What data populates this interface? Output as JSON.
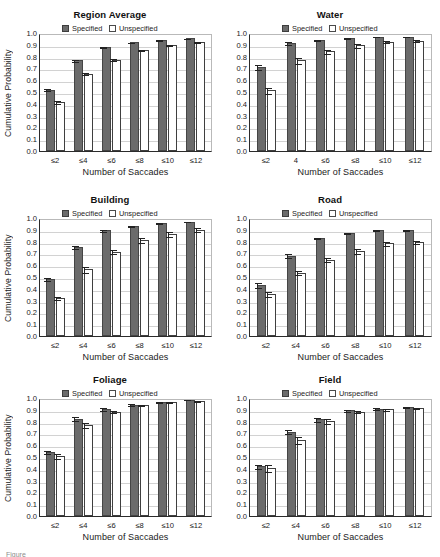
{
  "figure": {
    "legend": {
      "specified_label": "Specified",
      "unspecified_label": "Unspecified"
    },
    "axis": {
      "ylabel": "Cumulative Probability",
      "xlabel": "Number of Saccades",
      "yticks": [
        "1.0",
        "0.9",
        "0.8",
        "0.7",
        "0.6",
        "0.5",
        "0.4",
        "0.3",
        "0.2",
        "0.1",
        "0.0"
      ]
    },
    "caption_partial": "Figure"
  },
  "colors": {
    "specified_fill": "#6b6b6b",
    "specified_edge": "#454545",
    "unspecified_fill": "#ffffff",
    "unspecified_edge": "#3f3f3f",
    "gridline": "#d2d2d2",
    "axis": "#2b2b2b"
  },
  "chart_data": [
    {
      "type": "bar",
      "title": "Region Average",
      "xlabel": "Number of Saccades",
      "ylabel": "Cumulative Probability",
      "ylim": [
        0,
        1
      ],
      "grid": true,
      "legend_position": "top-center",
      "categories": [
        "≤2",
        "≤4",
        "≤6",
        "≤8",
        "≤10",
        "≤12"
      ],
      "series": [
        {
          "name": "Specified",
          "values": [
            0.52,
            0.77,
            0.88,
            0.92,
            0.94,
            0.955
          ],
          "errors": [
            0.012,
            0.012,
            0.008,
            0.008,
            0.006,
            0.005
          ]
        },
        {
          "name": "Unspecified",
          "values": [
            0.415,
            0.655,
            0.775,
            0.855,
            0.895,
            0.925
          ],
          "errors": [
            0.015,
            0.015,
            0.012,
            0.01,
            0.008,
            0.007
          ]
        }
      ]
    },
    {
      "type": "bar",
      "title": "Water",
      "xlabel": "Number of Saccades",
      "ylabel": "",
      "ylim": [
        0,
        1
      ],
      "grid": true,
      "legend_position": "top-center",
      "categories": [
        "≤2",
        "4",
        "≤6",
        "≤8",
        "≤10",
        "≤12"
      ],
      "series": [
        {
          "name": "Specified",
          "values": [
            0.71,
            0.915,
            0.94,
            0.955,
            0.97,
            0.97
          ],
          "errors": [
            0.025,
            0.015,
            0.01,
            0.008,
            0.006,
            0.006
          ]
        },
        {
          "name": "Unspecified",
          "values": [
            0.515,
            0.77,
            0.845,
            0.895,
            0.925,
            0.935
          ],
          "errors": [
            0.03,
            0.03,
            0.022,
            0.018,
            0.013,
            0.012
          ]
        }
      ]
    },
    {
      "type": "bar",
      "title": "Building",
      "xlabel": "Number of Saccades",
      "ylabel": "Cumulative Probability",
      "ylim": [
        0,
        1
      ],
      "grid": true,
      "legend_position": "top-center",
      "categories": [
        "≤2",
        "≤4",
        "≤6",
        "≤8",
        "≤10",
        "≤12"
      ],
      "series": [
        {
          "name": "Specified",
          "values": [
            0.485,
            0.755,
            0.895,
            0.935,
            0.955,
            0.97
          ],
          "errors": [
            0.015,
            0.015,
            0.012,
            0.01,
            0.008,
            0.006
          ]
        },
        {
          "name": "Unspecified",
          "values": [
            0.325,
            0.565,
            0.715,
            0.81,
            0.865,
            0.9
          ],
          "errors": [
            0.018,
            0.03,
            0.022,
            0.025,
            0.022,
            0.02
          ]
        }
      ]
    },
    {
      "type": "bar",
      "title": "Road",
      "xlabel": "Number of Saccades",
      "ylabel": "",
      "ylim": [
        0,
        1
      ],
      "grid": true,
      "legend_position": "top-center",
      "categories": [
        "≤2",
        "≤4",
        "≤6",
        "≤8",
        "≤10",
        "≤12"
      ],
      "series": [
        {
          "name": "Specified",
          "values": [
            0.435,
            0.68,
            0.83,
            0.875,
            0.895,
            0.9
          ],
          "errors": [
            0.025,
            0.022,
            0.012,
            0.01,
            0.008,
            0.008
          ]
        },
        {
          "name": "Unspecified",
          "values": [
            0.355,
            0.535,
            0.645,
            0.72,
            0.785,
            0.795
          ],
          "errors": [
            0.028,
            0.022,
            0.022,
            0.022,
            0.018,
            0.018
          ]
        }
      ]
    },
    {
      "type": "bar",
      "title": "Foliage",
      "xlabel": "Number of Saccades",
      "ylabel": "Cumulative Probability",
      "ylim": [
        0,
        1
      ],
      "grid": true,
      "legend_position": "top-center",
      "categories": [
        "≤2",
        "≤4",
        "≤6",
        "≤8",
        "≤10",
        "≤12"
      ],
      "series": [
        {
          "name": "Specified",
          "values": [
            0.545,
            0.825,
            0.91,
            0.945,
            0.965,
            0.985
          ],
          "errors": [
            0.018,
            0.022,
            0.018,
            0.012,
            0.008,
            0.006
          ]
        },
        {
          "name": "Unspecified",
          "values": [
            0.51,
            0.77,
            0.885,
            0.94,
            0.965,
            0.975
          ],
          "errors": [
            0.025,
            0.025,
            0.015,
            0.01,
            0.008,
            0.006
          ]
        }
      ]
    },
    {
      "type": "bar",
      "title": "Field",
      "xlabel": "Number of Saccades",
      "ylabel": "",
      "ylim": [
        0,
        1
      ],
      "grid": true,
      "legend_position": "top-center",
      "categories": [
        "≤2",
        "≤4",
        "≤6",
        "≤8",
        "≤10",
        "≤12"
      ],
      "series": [
        {
          "name": "Specified",
          "values": [
            0.42,
            0.715,
            0.82,
            0.895,
            0.91,
            0.925
          ],
          "errors": [
            0.025,
            0.022,
            0.022,
            0.012,
            0.01,
            0.01
          ]
        },
        {
          "name": "Unspecified",
          "values": [
            0.41,
            0.645,
            0.805,
            0.885,
            0.905,
            0.915
          ],
          "errors": [
            0.035,
            0.035,
            0.028,
            0.015,
            0.012,
            0.012
          ]
        }
      ]
    }
  ]
}
